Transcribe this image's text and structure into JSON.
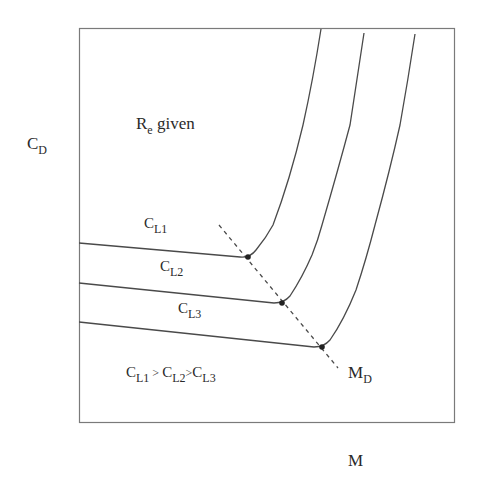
{
  "diagram": {
    "axes": {
      "y_label": {
        "main": "C",
        "sub": "D"
      },
      "x_label": {
        "main": "M"
      }
    },
    "annotation_reynolds": {
      "main": "R",
      "sub": "e",
      "suffix": " given"
    },
    "curves": [
      {
        "label_main": "C",
        "label_sub": "L1",
        "name": "C_L1"
      },
      {
        "label_main": "C",
        "label_sub": "L2",
        "name": "C_L2"
      },
      {
        "label_main": "C",
        "label_sub": "L3",
        "name": "C_L3"
      }
    ],
    "relation": {
      "parts": [
        {
          "main": "C",
          "sub": "L1"
        },
        {
          "sep": " > "
        },
        {
          "main": "C",
          "sub": "L2"
        },
        {
          "sep": ">"
        },
        {
          "main": "C",
          "sub": "L3"
        }
      ]
    },
    "divergence_line": {
      "label_main": "M",
      "label_sub": "D",
      "style": "dashed"
    },
    "colors": {
      "frame": "#6a6a6a",
      "curve": "#4a4a4a",
      "dot": "#222222",
      "text": "#2a2a2a"
    }
  }
}
